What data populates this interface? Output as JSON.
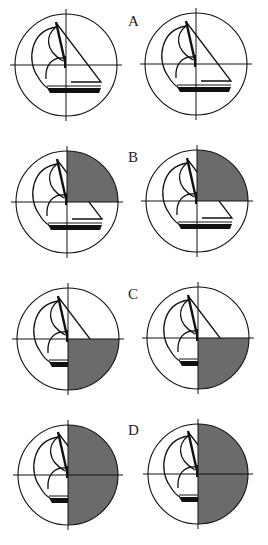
{
  "panels": [
    {
      "label": "A",
      "shaded": "none",
      "cy_left": 65,
      "cy_right": 64
    },
    {
      "label": "B",
      "shaded": "upper-right",
      "cy_left": 202,
      "cy_right": 201
    },
    {
      "label": "C",
      "shaded": "lower-right",
      "cy_left": 339,
      "cy_right": 338
    },
    {
      "label": "D",
      "shaded": "right-half",
      "cy_left": 475,
      "cy_right": 474
    }
  ],
  "colors": {
    "shade": "#6b6b6b",
    "line": "#111111"
  }
}
